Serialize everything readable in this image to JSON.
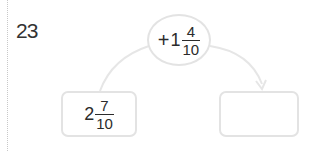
{
  "problem": {
    "number": "23"
  },
  "operation": {
    "operator": "+",
    "whole": "1",
    "numerator": "4",
    "denominator": "10"
  },
  "start_value": {
    "whole": "2",
    "numerator": "7",
    "denominator": "10"
  },
  "answer_box": {
    "value": ""
  },
  "colors": {
    "outline": "#e3e3e3",
    "text": "#2b2b2b",
    "dotted_rule": "#c8c8c8"
  }
}
